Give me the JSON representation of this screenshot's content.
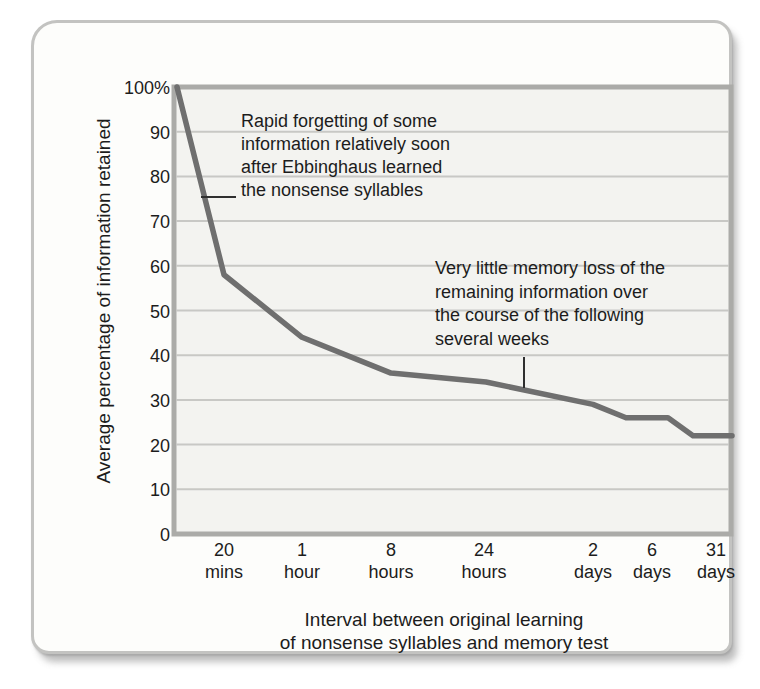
{
  "card": {
    "background": "#fdfdfb",
    "border_color": "#c3c3c1",
    "shadow_color": "#6e6e6e"
  },
  "chart_data": {
    "type": "line",
    "title": "",
    "ylabel": "Average percentage of information retained",
    "xlabel": "Interval between original learning\nof nonsense syllables and memory test",
    "ylim": [
      0,
      100
    ],
    "grid": true,
    "legend": "none",
    "yticks": [
      "100%",
      "90",
      "80",
      "70",
      "60",
      "50",
      "40",
      "30",
      "20",
      "10",
      "0"
    ],
    "categories": [
      "20 mins",
      "1 hour",
      "8 hours",
      "24 hours",
      "2 days",
      "6 days",
      "31 days"
    ],
    "series": [
      {
        "name": "Percentage of information retained",
        "start_value_at_learning": 100,
        "values": [
          58,
          44,
          36,
          34,
          28,
          26,
          22
        ]
      }
    ],
    "layout": {
      "plot_px": {
        "left": 140,
        "top": 64,
        "right": 697,
        "bottom": 511
      },
      "tick_x_px": [
        190,
        268,
        357,
        450,
        559,
        618,
        682
      ],
      "curve_anchors": [
        {
          "x": 143,
          "v": 100
        },
        {
          "x": 190,
          "v": 58
        },
        {
          "x": 268,
          "v": 44
        },
        {
          "x": 357,
          "v": 36
        },
        {
          "x": 452,
          "v": 34
        },
        {
          "x": 559,
          "v": 29
        },
        {
          "x": 592,
          "v": 26
        },
        {
          "x": 634,
          "v": 26
        },
        {
          "x": 659,
          "v": 22
        },
        {
          "x": 698,
          "v": 22
        }
      ],
      "colors": {
        "curve": "#6f6f6f",
        "grid": "#c8c8c5",
        "plot_border": "#ababa8",
        "plot_bg": "#f3f3f0",
        "text": "#1c1c1c",
        "leader_line": "#2f2f2f"
      }
    }
  },
  "annotations": [
    {
      "text": "Rapid forgetting of some\ninformation relatively soon\nafter Ebbinghaus learned\nthe nonsense syllables"
    },
    {
      "text": "Very little memory loss of the\nremaining information over\nthe course of the following\nseveral weeks"
    }
  ]
}
